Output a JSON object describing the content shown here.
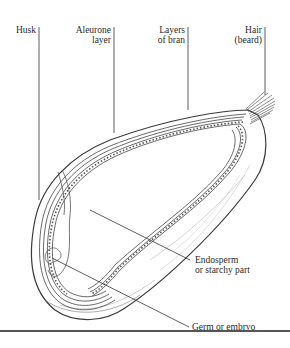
{
  "diagram": {
    "labels": {
      "husk": {
        "lines": [
          "Husk"
        ]
      },
      "aleurone": {
        "lines": [
          "Aleurone",
          "layer"
        ]
      },
      "bran": {
        "lines": [
          "Layers",
          "of bran"
        ]
      },
      "hair": {
        "lines": [
          "Hair",
          "(beard)"
        ]
      },
      "endosperm": {
        "lines": [
          "Endosperm",
          "or starchy part"
        ]
      },
      "germ": {
        "lines": [
          "Germ or embryo"
        ]
      }
    },
    "colors": {
      "ink": "#2a2a2a",
      "line": "#444444",
      "background": "#ffffff"
    }
  }
}
